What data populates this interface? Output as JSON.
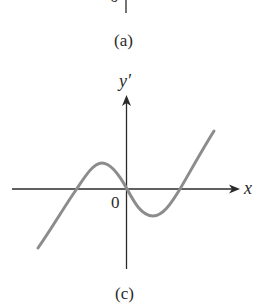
{
  "figure_a": {
    "caption": "(a)",
    "origin_label_partial": "0"
  },
  "figure_c": {
    "caption": "(c)",
    "y_axis_label": "y′",
    "x_axis_label": "x",
    "origin_label": "0",
    "curve_color": "#8c8c8c",
    "axis_color": "#2b2b2b"
  }
}
